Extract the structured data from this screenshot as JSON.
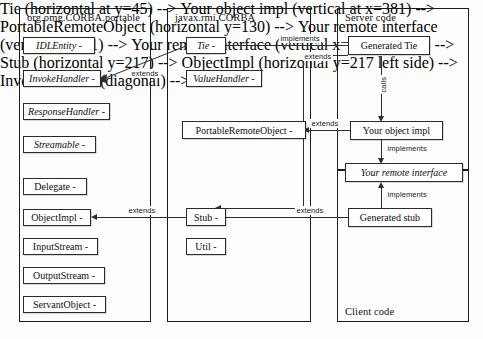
{
  "diagram": {
    "panels": [
      {
        "id": "corba_portable",
        "title": "org.omg.CORBA.portable"
      },
      {
        "id": "javax_rmi_corba",
        "title": "javax.rmi.CORBA"
      },
      {
        "id": "server_code",
        "title": "Server code"
      },
      {
        "id": "client_code",
        "title": "Client code"
      }
    ],
    "boxes": {
      "idlentity": "IDLEntity -",
      "invokehandler": "InvokeHandler -",
      "responsehandler": "ResponseHandler -",
      "streamable": "Streamable -",
      "delegate": "Delegate -",
      "objectimpl": "ObjectImpl -",
      "inputstream": "InputStream -",
      "outputstream": "OutputStream -",
      "servantobject": "ServantObject -",
      "tie": "Tie -",
      "valuehandler": "ValueHandler -",
      "portableremoteobject": "PortableRemoteObject -",
      "stub": "Stub -",
      "util": "Util -",
      "generated_tie": "Generated Tie",
      "your_object_impl": "Your object impl",
      "your_remote_interface": "Your remote interface",
      "generated_stub": "Generated stub"
    },
    "edges": {
      "tie_implements": "implements",
      "tie_extends_invokehandler": "extends",
      "objectimpl_extends": "extends",
      "generatedtie_extends_tie": "extends",
      "generatedtie_calls": "calls",
      "objimpl_extends_pro": "extends",
      "objimpl_implements": "implements",
      "generatedstub_extends_stub": "extends",
      "generatedstub_implements": "implements",
      "stub_extends_objectimpl": "extends"
    },
    "colors": {
      "line": "#2e2e2e",
      "panel_border": "#1b1b1b",
      "box_border": "#2b2b2b",
      "background": "#fdfdfd",
      "text": "#0d0d0d"
    }
  }
}
